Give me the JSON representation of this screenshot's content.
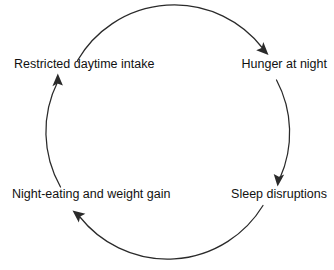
{
  "diagram": {
    "type": "cycle",
    "title": "",
    "direction": "clockwise",
    "shape": "circle",
    "stroke_color": "#2a2a2a",
    "text_color": "#111111",
    "background_color": "#ffffff",
    "center": {
      "x": 169,
      "y": 133
    },
    "radius": 112,
    "nodes": [
      {
        "id": "restricted-daytime-intake",
        "label": "Restricted daytime intake",
        "position": "top-left",
        "x": 14,
        "y": 68
      },
      {
        "id": "hunger-at-night",
        "label": "Hunger at night",
        "position": "top-right",
        "x": 327,
        "y": 68
      },
      {
        "id": "sleep-disruptions",
        "label": "Sleep disruptions",
        "position": "bottom-right",
        "x": 327,
        "y": 198
      },
      {
        "id": "night-eating-and-weight-gain",
        "label": "Night-eating and weight gain",
        "position": "bottom-left",
        "x": 12,
        "y": 198
      }
    ],
    "edges": [
      {
        "id": "edge-intake-to-hunger",
        "from": "restricted-daytime-intake",
        "to": "hunger-at-night",
        "arrow": "end",
        "arc": "top"
      },
      {
        "id": "edge-hunger-to-sleep",
        "from": "hunger-at-night",
        "to": "sleep-disruptions",
        "arrow": "end",
        "arc": "right"
      },
      {
        "id": "edge-sleep-to-night-eating",
        "from": "sleep-disruptions",
        "to": "night-eating-and-weight-gain",
        "arrow": "end",
        "arc": "bottom"
      },
      {
        "id": "edge-night-eating-to-intake",
        "from": "night-eating-and-weight-gain",
        "to": "restricted-daytime-intake",
        "arrow": "end",
        "arc": "left"
      }
    ]
  }
}
